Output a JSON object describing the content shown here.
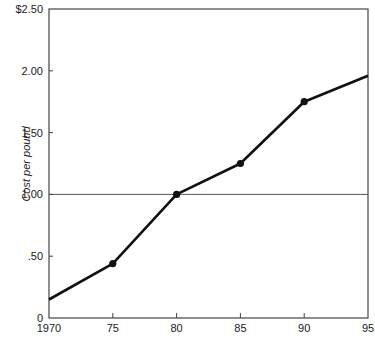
{
  "chart_data": {
    "type": "line",
    "title": "",
    "xlabel": "",
    "ylabel": "Cost per pound",
    "x": [
      1970,
      1975,
      1980,
      1985,
      1990,
      1995
    ],
    "x_tick_labels": [
      "1970",
      "75",
      "80",
      "85",
      "90",
      "95"
    ],
    "y_tick_values": [
      0,
      0.5,
      1.0,
      1.5,
      2.0,
      2.5
    ],
    "y_tick_labels": [
      "0",
      ".50",
      "1.00",
      "1.50",
      "2.00",
      "$2.50"
    ],
    "series": [
      {
        "name": "Cost per pound",
        "values": [
          0.15,
          0.44,
          1.0,
          1.25,
          1.75,
          1.96
        ],
        "markers": [
          false,
          true,
          true,
          true,
          true,
          false
        ]
      }
    ],
    "reference_lines": [
      {
        "axis": "y",
        "value": 1.0
      }
    ],
    "xlim": [
      1970,
      1995
    ],
    "ylim": [
      0,
      2.5
    ],
    "grid": false,
    "legend": "none",
    "line_color": "#111111"
  }
}
